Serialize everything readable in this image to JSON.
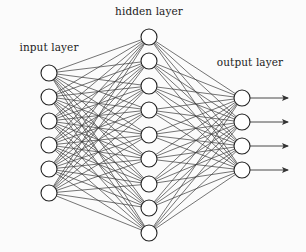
{
  "diagram": {
    "type": "feedforward-neural-network",
    "colors": {
      "background": "#fbfbfb",
      "edge": "#3a3a3a",
      "node_stroke": "#222222",
      "node_fill": "#ffffff",
      "text": "#222222"
    },
    "node_radius": 8,
    "layers": [
      {
        "id": "input",
        "label": "input layer",
        "x": 49,
        "node_count": 6,
        "y_positions": [
          73,
          97,
          121,
          145,
          169,
          193
        ],
        "label_pos": {
          "x": 49,
          "y": 41
        }
      },
      {
        "id": "hidden",
        "label": "hidden layer",
        "x": 149,
        "node_count": 9,
        "y_positions": [
          37,
          61,
          86,
          110,
          135,
          159,
          184,
          208,
          233
        ],
        "label_pos": {
          "x": 149,
          "y": 5
        }
      },
      {
        "id": "output",
        "label": "output layer",
        "x": 242,
        "node_count": 4,
        "y_positions": [
          98,
          122,
          146,
          170
        ],
        "label_pos": {
          "x": 250,
          "y": 56
        }
      }
    ],
    "connections": "fully-connected",
    "output_arrows": {
      "count": 4,
      "end_x": 288,
      "icon": "arrow-right-icon"
    }
  }
}
